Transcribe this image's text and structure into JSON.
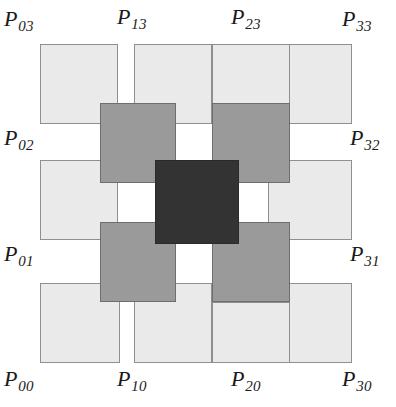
{
  "figure": {
    "type": "diagram",
    "width": 396,
    "height": 407,
    "background": "#ffffff"
  },
  "colors": {
    "light_fill": "#eaeaea",
    "light_stroke": "#8f8f8f",
    "mid_fill": "#9a9a9a",
    "mid_stroke": "#6e6e6e",
    "dark_fill": "#333333",
    "dark_stroke": "#2a2a2a",
    "label_color": "#1a1a1a",
    "background": "#ffffff"
  },
  "tiles": [
    {
      "name": "tile-outer-top-left",
      "shade": "light",
      "x": 40,
      "y": 44,
      "w": 78,
      "h": 80
    },
    {
      "name": "tile-outer-top-midleft",
      "shade": "light",
      "x": 134,
      "y": 44,
      "w": 78,
      "h": 80
    },
    {
      "name": "tile-outer-top-midright",
      "shade": "light",
      "x": 212,
      "y": 44,
      "w": 0,
      "h": 0
    },
    {
      "name": "tile-outer-top-right",
      "shade": "light",
      "x": 268,
      "y": 44,
      "w": 84,
      "h": 80
    },
    {
      "name": "tile-outer-left-upper",
      "shade": "light",
      "x": 40,
      "y": 160,
      "w": 78,
      "h": 80
    },
    {
      "name": "tile-outer-right-upper",
      "shade": "light",
      "x": 268,
      "y": 160,
      "w": 84,
      "h": 80
    },
    {
      "name": "tile-outer-left-lower",
      "shade": "light",
      "x": 40,
      "y": 283,
      "w": 80,
      "h": 80
    },
    {
      "name": "tile-outer-bottom-mid",
      "shade": "light",
      "x": 134,
      "y": 283,
      "w": 78,
      "h": 80
    },
    {
      "name": "tile-outer-right-lower",
      "shade": "light",
      "x": 268,
      "y": 283,
      "w": 84,
      "h": 80
    },
    {
      "name": "tile-inner-top-left",
      "shade": "mid",
      "x": 100,
      "y": 103,
      "w": 76,
      "h": 80
    },
    {
      "name": "tile-inner-top-right",
      "shade": "mid",
      "x": 212,
      "y": 103,
      "w": 78,
      "h": 80
    },
    {
      "name": "tile-inner-bottom-left",
      "shade": "mid",
      "x": 100,
      "y": 222,
      "w": 76,
      "h": 80
    },
    {
      "name": "tile-inner-bottom-right",
      "shade": "mid",
      "x": 212,
      "y": 222,
      "w": 78,
      "h": 80
    },
    {
      "name": "tile-center",
      "shade": "dark",
      "x": 155,
      "y": 160,
      "w": 84,
      "h": 84
    }
  ],
  "extra_tiles": [
    {
      "name": "tile-outer-top-second",
      "shade": "light",
      "x": 212,
      "y": 44,
      "w": 78,
      "h": 60
    },
    {
      "name": "tile-outer-bottom-second",
      "shade": "light",
      "x": 212,
      "y": 302,
      "w": 78,
      "h": 61
    }
  ],
  "labels": [
    {
      "name": "label-p03",
      "base": "P",
      "sub": "03",
      "x": 4,
      "y": 8,
      "align": "left"
    },
    {
      "name": "label-p13",
      "base": "P",
      "sub": "13",
      "x": 117,
      "y": 6,
      "align": "left"
    },
    {
      "name": "label-p23",
      "base": "P",
      "sub": "23",
      "x": 231,
      "y": 6,
      "align": "left"
    },
    {
      "name": "label-p33",
      "base": "P",
      "sub": "33",
      "x": 342,
      "y": 8,
      "align": "left"
    },
    {
      "name": "label-p02",
      "base": "P",
      "sub": "02",
      "x": 4,
      "y": 127,
      "align": "left"
    },
    {
      "name": "label-p32",
      "base": "P",
      "sub": "32",
      "x": 350,
      "y": 127,
      "align": "left"
    },
    {
      "name": "label-p01",
      "base": "P",
      "sub": "01",
      "x": 4,
      "y": 243,
      "align": "left"
    },
    {
      "name": "label-p31",
      "base": "P",
      "sub": "31",
      "x": 350,
      "y": 243,
      "align": "left"
    },
    {
      "name": "label-p00",
      "base": "P",
      "sub": "00",
      "x": 4,
      "y": 368,
      "align": "left"
    },
    {
      "name": "label-p10",
      "base": "P",
      "sub": "10",
      "x": 117,
      "y": 368,
      "align": "left"
    },
    {
      "name": "label-p20",
      "base": "P",
      "sub": "20",
      "x": 231,
      "y": 368,
      "align": "left"
    },
    {
      "name": "label-p30",
      "base": "P",
      "sub": "30",
      "x": 342,
      "y": 368,
      "align": "left"
    }
  ]
}
